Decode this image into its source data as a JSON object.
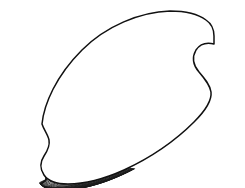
{
  "figure": {
    "kind": "scientific-line-drawing",
    "subject_label": "bivalve shell valve",
    "title": "",
    "caption": "",
    "background_color": "#ffffff",
    "ink_color": "#1a1a1a",
    "outline_color": "#111111",
    "canvas": {
      "width": 245,
      "height": 188
    },
    "orientation": "umbo at lower left, ventral margin lower right",
    "technique": "pen-and-ink hatching"
  },
  "outline": {
    "name": "shell-valve-outline",
    "description": "ovate-triangular valve with concave posterior sinus at right and concave anterior notch at lower left",
    "path": "M 42 124 C 44 104 56 76 82 50 C 106 26 140 12 170 11 C 186 11 198 14 206 20 C 212 24 214 29 214 36 L 214 44 C 206 42 200 44 196 50 C 192 57 193 65 199 72 C 205 79 210 85 211 92 C 212 100 206 110 194 122 C 176 140 150 158 124 170 C 104 179 84 184 68 184 C 56 184 48 181 44 175 C 40 169 40 162 44 156 C 48 150 50 145 49 140 C 48 135 44 130 42 124 Z"
  },
  "ribs": {
    "name": "radial-ribs",
    "count": 44,
    "description": "fine close-set radial ribs fanning from the lower-left umbo to the dorsal and ventral margins, crenulating the dorsal edge",
    "stroke_width": 1.25,
    "umbo_origin": {
      "x": 40,
      "y": 173
    },
    "crenulate_margin": true
  },
  "growth_lines": {
    "name": "concentric-growth-lines",
    "count": 22,
    "description": "concentric growth increments crossing the ribs, dense along the ventral margin producing a cross-hatched cancellate texture",
    "stroke_width": 0.85,
    "region": "ventral and posterior margin"
  },
  "regions": [
    {
      "name": "dorsal-margin",
      "label": "dorsal margin",
      "note": "upper arched edge, crenulated by rib terminations"
    },
    {
      "name": "posterior-sinus",
      "label": "posterior sinus",
      "note": "concave notch on right side below the posterior wing"
    },
    {
      "name": "posterior-wing",
      "label": "posterior wing",
      "note": "squared projection at upper right"
    },
    {
      "name": "ventral-margin",
      "label": "ventral margin",
      "note": "lower curved edge with dense cross-hatching"
    },
    {
      "name": "anterior-notch",
      "label": "anterior notch",
      "note": "concave indentation at lower left near the umbo"
    },
    {
      "name": "umbo",
      "label": "umbo",
      "note": "beak at lower left, origin of the radial ribs"
    }
  ]
}
